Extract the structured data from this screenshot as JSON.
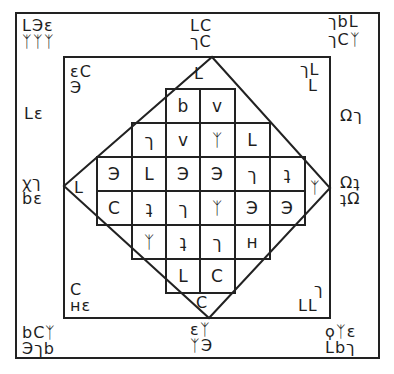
{
  "diagram": {
    "title": "",
    "line_color": "#222222",
    "background": "#ffffff"
  },
  "outer_frame": {
    "corners": {
      "top_left": [
        "LЭε",
        "ᛉᛉᛉ"
      ],
      "top_right": [
        "ךbL",
        "ךCᛉ"
      ],
      "bottom_left": [
        "bCᛉ",
        "Эךb"
      ],
      "bottom_right": [
        "ϙᛉε",
        "Lbך"
      ]
    },
    "edges": {
      "top_center": [
        "LC",
        "ךC"
      ],
      "left_upper": "Lε",
      "left_center": [
        "ꭓך",
        "bε"
      ],
      "right_upper": "Ωך",
      "right_center": [
        "Ωʇ",
        "ʇΩ"
      ],
      "bottom_center": [
        "εᛉ",
        "ᛉЭ"
      ]
    }
  },
  "inner_frame": {
    "corners": {
      "top_left": [
        "εC",
        "Э"
      ],
      "top_right": [
        "ךL",
        "L"
      ],
      "bottom_left": [
        "C",
        "ʜε"
      ],
      "bottom_right": [
        "ך",
        "LԼ"
      ]
    }
  },
  "diamond_tips": {
    "top": "L",
    "left": "L",
    "right": "ᛉ",
    "bottom": "C"
  },
  "grid": {
    "rows": [
      {
        "cells": [
          null,
          null,
          "b",
          "v",
          null,
          null
        ]
      },
      {
        "cells": [
          null,
          "ך",
          "v",
          "ᛉ",
          "L",
          null
        ]
      },
      {
        "cells": [
          "Э",
          "L",
          "Э",
          "Э",
          "ך",
          "ʇ"
        ]
      },
      {
        "cells": [
          "C",
          "ʇ",
          "ך",
          "ᛉ",
          "Э",
          "Э"
        ]
      },
      {
        "cells": [
          null,
          "ᛉ",
          "ʇ",
          "ך",
          "ʜ",
          null
        ]
      },
      {
        "cells": [
          null,
          null,
          "L",
          "C",
          null,
          null
        ]
      }
    ]
  }
}
